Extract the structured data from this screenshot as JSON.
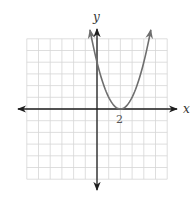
{
  "chart_data": {
    "type": "line",
    "title": "",
    "xlabel": "x",
    "ylabel": "y",
    "xlim": [
      -6,
      6
    ],
    "ylim": [
      -6,
      6
    ],
    "grid": true,
    "grid_step": 1,
    "tick_labels": [
      {
        "axis": "x",
        "value": 2,
        "label": "2"
      }
    ],
    "series": [
      {
        "name": "parabola",
        "equation": "y = (x - 2)^2",
        "vertex": [
          2,
          0
        ],
        "y_intercept": 4,
        "x": [
          -0.6,
          0,
          0.5,
          1,
          1.5,
          2,
          2.5,
          3,
          3.5,
          4,
          4.6
        ],
        "values": [
          6.76,
          4,
          2.25,
          1,
          0.25,
          0,
          0.25,
          1,
          2.25,
          4,
          6.76
        ],
        "arrows_at_ends": true
      }
    ],
    "legend": null
  },
  "colors": {
    "grid": "#d6d6d6",
    "axes": "#1e1e1e",
    "curve": "#6e6e6e",
    "text": "#333333"
  },
  "labels": {
    "x_axis": "x",
    "y_axis": "y",
    "tick_2": "2"
  }
}
